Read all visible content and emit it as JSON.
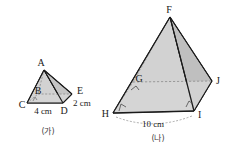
{
  "figures": [
    {
      "id": "figure-ga",
      "caption": "(가)",
      "vertex_labels": {
        "apex": "A",
        "back": "B",
        "right": "E",
        "left_base": "C",
        "front_base": "D"
      },
      "dimensions": [
        {
          "name": "base-edge",
          "text": "4 cm"
        },
        {
          "name": "side-edge",
          "text": "2 cm"
        }
      ]
    },
    {
      "id": "figure-na",
      "caption": "(나)",
      "vertex_labels": {
        "apex": "F",
        "back": "G",
        "right": "J",
        "left_base": "H",
        "front_base": "I"
      },
      "dimensions": [
        {
          "name": "base-edge",
          "text": "10 cm"
        }
      ]
    }
  ],
  "colors": {
    "stroke": "#1a1a1a",
    "face_light": "#d9d9d9",
    "face_mid": "#cfcfcf",
    "face_dark": "#c2c2c2",
    "hidden": "#8a8a8a",
    "text": "#1a1a1a",
    "caption": "#444444"
  }
}
